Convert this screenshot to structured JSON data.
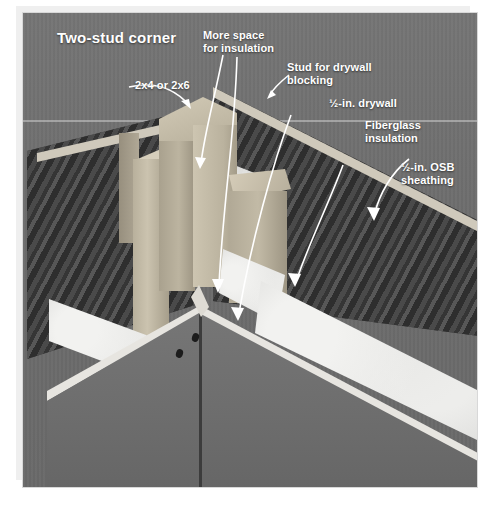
{
  "figure": {
    "title": "Two-stud corner",
    "kind": "construction-detail-photo"
  },
  "callouts": [
    {
      "id": "framing-size",
      "name": "2x4-or-2x6",
      "text": "2x4 or 2x6"
    },
    {
      "id": "more-space",
      "name": "more-space",
      "text": "More space\nfor insulation"
    },
    {
      "id": "drywall-blocking",
      "name": "stud-for-blocking",
      "text": "Stud for drywall\nblocking"
    },
    {
      "id": "drywall",
      "name": "half-in-drywall",
      "text": "½-in. drywall"
    },
    {
      "id": "fiberglass",
      "name": "fiberglass",
      "text": "Fiberglass\ninsulation"
    },
    {
      "id": "osb",
      "name": "half-in-osb",
      "text": "½-in. OSB\nsheathing"
    }
  ],
  "materials": {
    "framing_lumber": "2x4 or 2x6 framing lumber",
    "sheathing": "½-in. OSB sheathing",
    "insulation": "Fiberglass insulation",
    "wallboard": "½-in. drywall"
  },
  "colors": {
    "backdrop_gray": "#6e6e6e",
    "lumber_tan": "#bdb5a1",
    "osb_dark": "#3d3d3d",
    "insulation_white": "#d3d3d1",
    "drywall_gray": "#6d6d6d",
    "leader_white": "#ffffff",
    "page_white": "#ffffff"
  }
}
